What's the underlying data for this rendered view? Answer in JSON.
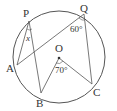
{
  "figure": {
    "type": "circle-geometry",
    "circle": {
      "center": [
        59,
        57
      ],
      "radius": 46
    },
    "points": {
      "P": {
        "label": "P",
        "x": 29,
        "y": 21
      },
      "Q": {
        "label": "Q",
        "x": 84,
        "y": 14
      },
      "A": {
        "label": "A",
        "x": 17,
        "y": 65
      },
      "B": {
        "label": "B",
        "x": 41,
        "y": 93
      },
      "C": {
        "label": "C",
        "x": 92,
        "y": 84
      },
      "O": {
        "label": "O",
        "x": 59,
        "y": 58
      }
    },
    "segments": [
      [
        "P",
        "A"
      ],
      [
        "P",
        "B"
      ],
      [
        "A",
        "Q"
      ],
      [
        "Q",
        "C"
      ],
      [
        "O",
        "B"
      ],
      [
        "O",
        "C"
      ]
    ],
    "angles": {
      "at_P": "x",
      "at_Q": "60°",
      "at_O": "70°"
    },
    "colors": {
      "stroke": "#555555",
      "text": "#333333"
    }
  }
}
